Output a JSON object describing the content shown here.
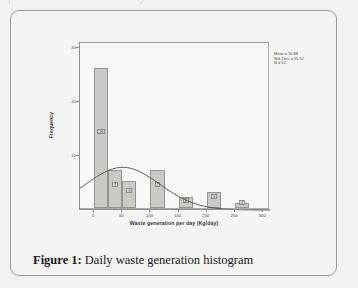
{
  "figure": {
    "caption_label": "Figure 1:",
    "caption_text": "Daily waste generation histogram"
  },
  "chart_data": {
    "type": "bar",
    "title": "",
    "xlabel": "Waste generation per day (Kg/day)",
    "ylabel": "Frequency",
    "xlim": [
      -25,
      312
    ],
    "ylim": [
      0,
      31
    ],
    "xticks": [
      "0",
      "50",
      "100",
      "150",
      "200",
      "250",
      "300"
    ],
    "xtick_values": [
      0,
      50,
      100,
      150,
      200,
      250,
      300
    ],
    "yticks": [
      "10",
      "20",
      "30"
    ],
    "ytick_values": [
      10,
      20,
      30
    ],
    "grid": false,
    "bin_width": 25,
    "bars": [
      {
        "bin_start": 0,
        "bin_end": 25,
        "value": 26,
        "label": "26"
      },
      {
        "bin_start": 25,
        "bin_end": 50,
        "value": 7,
        "label": "7"
      },
      {
        "bin_start": 50,
        "bin_end": 75,
        "value": 5,
        "label": "5"
      },
      {
        "bin_start": 100,
        "bin_end": 125,
        "value": 7,
        "label": "7"
      },
      {
        "bin_start": 150,
        "bin_end": 175,
        "value": 2,
        "label": "2"
      },
      {
        "bin_start": 200,
        "bin_end": 225,
        "value": 3,
        "label": "3"
      },
      {
        "bin_start": 250,
        "bin_end": 275,
        "value": 1,
        "label": "1"
      }
    ],
    "overlay": {
      "type": "normal-curve",
      "mean": 50.88,
      "std_dev": 65.52,
      "n": 52
    },
    "annotations": {
      "mean_line": "Mean = 50.88",
      "std_dev_line": "Std. Dev. = 65.52",
      "n_line": "N = 52"
    }
  },
  "colors": {
    "bar_fill": "#c9c9c5",
    "bar_border": "#96968f",
    "curve": "#4a4a46",
    "axis": "#8f8f8c",
    "page_background": "#f2f2f0",
    "frame_border": "#9b9b99"
  }
}
